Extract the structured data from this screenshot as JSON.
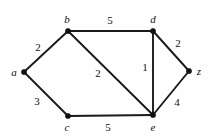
{
  "figure": {
    "type": "weighted-undirected-graph",
    "width": 215,
    "height": 140,
    "background_color": "#fefefe",
    "ink_color": "#111111"
  },
  "chart_data": {
    "type": "diagram",
    "title": "",
    "xlabel": "",
    "ylabel": "",
    "nodes": [
      {
        "id": "a",
        "label": "a",
        "x": 24,
        "y": 72,
        "label_x": 14,
        "label_y": 72
      },
      {
        "id": "b",
        "label": "b",
        "x": 68,
        "y": 31,
        "label_x": 67,
        "label_y": 19
      },
      {
        "id": "c",
        "label": "c",
        "x": 68,
        "y": 116,
        "label_x": 67,
        "label_y": 127
      },
      {
        "id": "d",
        "label": "d",
        "x": 153,
        "y": 31,
        "label_x": 153,
        "label_y": 19
      },
      {
        "id": "e",
        "label": "e",
        "x": 153,
        "y": 115,
        "label_x": 153,
        "label_y": 127
      },
      {
        "id": "z",
        "label": "z",
        "x": 189,
        "y": 71,
        "label_x": 199,
        "label_y": 71
      }
    ],
    "edges": [
      {
        "id": "ab",
        "source": "a",
        "target": "b",
        "weight": 5,
        "weight_label": "2",
        "label_x": 38,
        "label_y": 47
      },
      {
        "id": "ac",
        "source": "a",
        "target": "c",
        "weight": 3,
        "weight_label": "3",
        "label_x": 37,
        "label_y": 101
      },
      {
        "id": "bd",
        "source": "b",
        "target": "d",
        "weight": 5,
        "weight_label": "5",
        "label_x": 110,
        "label_y": 20
      },
      {
        "id": "be",
        "source": "b",
        "target": "e",
        "weight": 2,
        "weight_label": "2",
        "label_x": 98,
        "label_y": 73
      },
      {
        "id": "ce",
        "source": "c",
        "target": "e",
        "weight": 5,
        "weight_label": "5",
        "label_x": 108,
        "label_y": 127
      },
      {
        "id": "de",
        "source": "d",
        "target": "e",
        "weight": 1,
        "weight_label": "1",
        "label_x": 145,
        "label_y": 67
      },
      {
        "id": "dz",
        "source": "d",
        "target": "z",
        "weight": 2,
        "weight_label": "2",
        "label_x": 178,
        "label_y": 43
      },
      {
        "id": "ez",
        "source": "e",
        "target": "z",
        "weight": 4,
        "weight_label": "4",
        "label_x": 177,
        "label_y": 102
      }
    ]
  }
}
